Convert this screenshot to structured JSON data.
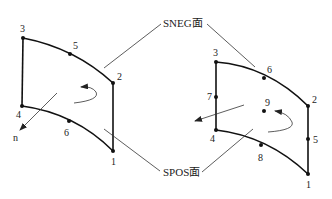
{
  "callouts": {
    "sneg": "SNEG面",
    "spos": "SPOS面"
  },
  "left_shape": {
    "nodes": [
      {
        "id": "3",
        "label": "3"
      },
      {
        "id": "5",
        "label": "5"
      },
      {
        "id": "2",
        "label": "2"
      },
      {
        "id": "4",
        "label": "4"
      },
      {
        "id": "6",
        "label": "6"
      },
      {
        "id": "1",
        "label": "1"
      }
    ],
    "normal_label": "n"
  },
  "right_shape": {
    "nodes": [
      {
        "id": "3",
        "label": "3"
      },
      {
        "id": "6",
        "label": "6"
      },
      {
        "id": "2",
        "label": "2"
      },
      {
        "id": "7",
        "label": "7"
      },
      {
        "id": "9",
        "label": "9"
      },
      {
        "id": "4",
        "label": "4"
      },
      {
        "id": "8",
        "label": "8"
      },
      {
        "id": "5",
        "label": "5"
      },
      {
        "id": "1",
        "label": "1"
      }
    ]
  },
  "colors": {
    "line": "#111111",
    "background": "#ffffff"
  }
}
